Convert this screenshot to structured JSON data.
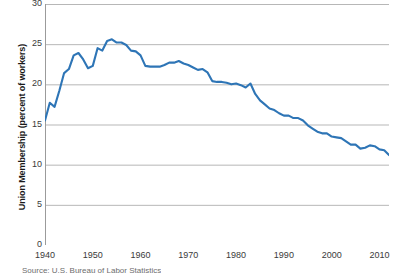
{
  "chart_data": {
    "type": "line",
    "title": "",
    "xlabel": "",
    "ylabel": "Union Membership (percent of workers)",
    "xlim": [
      1940,
      2012
    ],
    "ylim": [
      0,
      30
    ],
    "xticks": [
      1940,
      1950,
      1960,
      1970,
      1980,
      1990,
      2000,
      2010
    ],
    "yticks": [
      0,
      5,
      10,
      15,
      20,
      25,
      30
    ],
    "grid": "horizontal",
    "legend": "none",
    "line_color": "#2e75b6",
    "series": [
      {
        "name": "Union Membership",
        "x": [
          1940,
          1941,
          1942,
          1943,
          1944,
          1945,
          1946,
          1947,
          1948,
          1949,
          1950,
          1951,
          1952,
          1953,
          1954,
          1955,
          1956,
          1957,
          1958,
          1959,
          1960,
          1961,
          1962,
          1963,
          1964,
          1965,
          1966,
          1967,
          1968,
          1969,
          1970,
          1971,
          1972,
          1973,
          1974,
          1975,
          1976,
          1977,
          1978,
          1979,
          1980,
          1981,
          1982,
          1983,
          1984,
          1985,
          1986,
          1987,
          1988,
          1989,
          1990,
          1991,
          1992,
          1993,
          1994,
          1995,
          1996,
          1997,
          1998,
          1999,
          2000,
          2001,
          2002,
          2003,
          2004,
          2005,
          2006,
          2007,
          2008,
          2009,
          2010,
          2011,
          2012
        ],
        "y": [
          15.5,
          17.7,
          17.2,
          19.2,
          21.4,
          21.9,
          23.6,
          23.9,
          23.1,
          22.0,
          22.3,
          24.5,
          24.2,
          25.4,
          25.6,
          25.2,
          25.2,
          24.9,
          24.2,
          24.1,
          23.6,
          22.3,
          22.2,
          22.2,
          22.2,
          22.4,
          22.7,
          22.7,
          22.9,
          22.6,
          22.4,
          22.1,
          21.8,
          21.9,
          21.5,
          20.4,
          20.3,
          20.3,
          20.2,
          20.0,
          20.1,
          19.9,
          19.6,
          20.1,
          18.8,
          18.0,
          17.5,
          17.0,
          16.8,
          16.4,
          16.1,
          16.1,
          15.8,
          15.8,
          15.5,
          14.9,
          14.5,
          14.1,
          13.9,
          13.9,
          13.5,
          13.4,
          13.3,
          12.9,
          12.5,
          12.5,
          12.0,
          12.1,
          12.4,
          12.3,
          11.9,
          11.8,
          11.2
        ]
      }
    ]
  },
  "axis": {
    "y_tick_labels": [
      "30",
      "25",
      "20",
      "15",
      "10",
      "5",
      "0"
    ],
    "x_tick_labels": [
      "1940",
      "1950",
      "1960",
      "1970",
      "1980",
      "1990",
      "2000",
      "2010"
    ],
    "y_title": "Union Membership (percent of workers)"
  },
  "caption": {
    "source": "Source: U.S. Bureau of Labor Statistics"
  }
}
